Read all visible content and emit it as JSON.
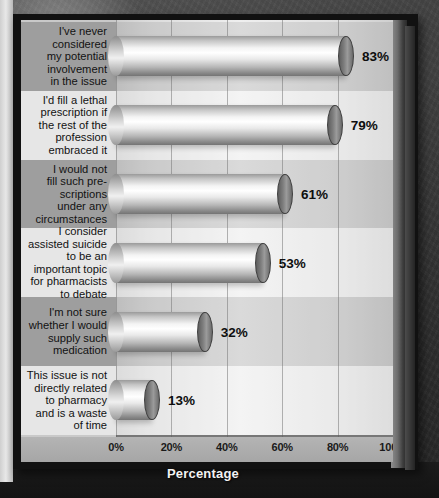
{
  "chart_data": {
    "type": "bar",
    "orientation": "horizontal",
    "title": "",
    "xlabel": "Percentage",
    "ylabel": "",
    "xlim": [
      0,
      100
    ],
    "xticks": [
      "0%",
      "20%",
      "40%",
      "60%",
      "80%",
      "100%"
    ],
    "xtick_values": [
      0,
      20,
      40,
      60,
      80,
      100
    ],
    "grid": true,
    "legend": null,
    "categories": [
      "I've never considered my potential involvement in the issue",
      "I'd fill a lethal prescription if the rest of the profession embraced it",
      "I would not fill such pre-scriptions under any circumstances",
      "I consider assisted suicide to be an important topic for pharmacists to debate",
      "I'm not sure whether I would supply such medication",
      "This issue is not directly related to pharmacy and is a waste of time"
    ],
    "values": [
      83,
      79,
      61,
      53,
      32,
      13
    ],
    "data_labels": [
      "83%",
      "79%",
      "61%",
      "53%",
      "32%",
      "13%"
    ]
  },
  "category_lines": [
    [
      "I've never",
      "considered",
      "my potential",
      "involvement",
      "in the issue"
    ],
    [
      "I'd fill a lethal",
      "prescription if",
      "the rest of the",
      "profession",
      "embraced it"
    ],
    [
      "I would not",
      "fill such pre-",
      "scriptions",
      "under any",
      "circumstances"
    ],
    [
      "I consider",
      "assisted suicide",
      "to be an",
      "important topic",
      "for pharmacists",
      "to debate"
    ],
    [
      "I'm not sure",
      "whether I would",
      "supply such",
      "medication"
    ],
    [
      "This issue is not",
      "directly related",
      "to pharmacy",
      "and is a waste",
      "of time"
    ]
  ],
  "colors": {
    "backdrop": "#3a3a3a",
    "panel": "#c9c9c9",
    "band_dark": "#9e9e9e",
    "band_light": "#e6e6e6",
    "bar_highlight": "#ffffff",
    "bar_shadow": "#747474",
    "axis_text": "#1a1a1a",
    "axis_title_text": "#f2f2f2",
    "grid_line": "#787878"
  }
}
